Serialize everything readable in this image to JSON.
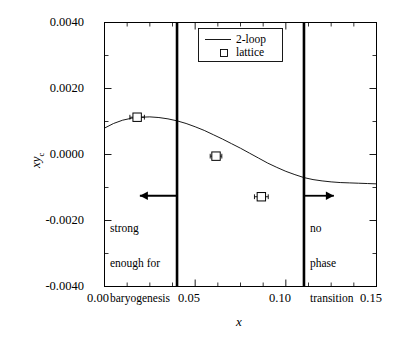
{
  "chart_data": {
    "type": "line",
    "title": "",
    "xlabel": "x",
    "ylabel": "xy_c",
    "xlim": [
      0.0,
      0.15
    ],
    "ylim": [
      -0.004,
      0.004
    ],
    "grid": false,
    "legend_position": "top-center-right",
    "x_ticks": [
      0.0,
      0.05,
      0.1,
      0.15
    ],
    "x_tick_labels": [
      "0.00",
      "0.05",
      "0.10",
      "0.15"
    ],
    "x_minor_ticks": [
      0.0125,
      0.025,
      0.0375,
      0.0625,
      0.075,
      0.0875,
      0.1125,
      0.125,
      0.1375
    ],
    "y_ticks": [
      -0.004,
      -0.002,
      0.0,
      0.002,
      0.004
    ],
    "y_tick_labels": [
      "-0.0040",
      "-0.0020",
      "0.0000",
      "0.0020",
      "0.0040"
    ],
    "y_minor_ticks": [
      -0.003,
      -0.001,
      0.001,
      0.003
    ],
    "series": [
      {
        "name": "2-loop",
        "type": "line",
        "points": [
          {
            "x": 0.0,
            "y": 0.0008
          },
          {
            "x": 0.005,
            "y": 0.00094
          },
          {
            "x": 0.01,
            "y": 0.00104
          },
          {
            "x": 0.015,
            "y": 0.0011
          },
          {
            "x": 0.02,
            "y": 0.00113
          },
          {
            "x": 0.025,
            "y": 0.00114
          },
          {
            "x": 0.03,
            "y": 0.00112
          },
          {
            "x": 0.035,
            "y": 0.00108
          },
          {
            "x": 0.04,
            "y": 0.00102
          },
          {
            "x": 0.045,
            "y": 0.00094
          },
          {
            "x": 0.05,
            "y": 0.00084
          },
          {
            "x": 0.055,
            "y": 0.00073
          },
          {
            "x": 0.06,
            "y": 0.0006
          },
          {
            "x": 0.065,
            "y": 0.00047
          },
          {
            "x": 0.07,
            "y": 0.00033
          },
          {
            "x": 0.075,
            "y": 0.00019
          },
          {
            "x": 0.08,
            "y": 4e-05
          },
          {
            "x": 0.085,
            "y": -0.00011
          },
          {
            "x": 0.09,
            "y": -0.00026
          },
          {
            "x": 0.095,
            "y": -0.00039
          },
          {
            "x": 0.1,
            "y": -0.00051
          },
          {
            "x": 0.105,
            "y": -0.00061
          },
          {
            "x": 0.11,
            "y": -0.0007
          },
          {
            "x": 0.115,
            "y": -0.00076
          },
          {
            "x": 0.12,
            "y": -0.0008
          },
          {
            "x": 0.125,
            "y": -0.00083
          },
          {
            "x": 0.13,
            "y": -0.00085
          },
          {
            "x": 0.135,
            "y": -0.00086
          },
          {
            "x": 0.14,
            "y": -0.00087
          },
          {
            "x": 0.145,
            "y": -0.00088
          },
          {
            "x": 0.15,
            "y": -0.00089
          }
        ]
      },
      {
        "name": "lattice",
        "type": "scatter",
        "marker": "open-square",
        "points": [
          {
            "x": 0.018,
            "y": 0.00113,
            "xerr": 0.004
          },
          {
            "x": 0.0615,
            "y": -5e-05,
            "xerr": 0.0032
          },
          {
            "x": 0.0865,
            "y": -0.00128,
            "xerr": 0.0038
          }
        ]
      }
    ],
    "vertical_lines": [
      {
        "x": 0.04
      },
      {
        "x": 0.11
      }
    ],
    "arrows": [
      {
        "from_x": 0.04,
        "to_x": 0.0195,
        "y": -0.00125,
        "direction": "left"
      },
      {
        "from_x": 0.11,
        "to_x": 0.1265,
        "y": -0.00125,
        "direction": "right"
      }
    ],
    "annotations": [
      {
        "text": "strong\nenough for\nbaryogenesis",
        "x": 0.0045,
        "y": -0.00205
      },
      {
        "text": "no\nphase\ntransition",
        "x": 0.1145,
        "y": -0.00205
      }
    ]
  },
  "legend": {
    "entries": [
      {
        "label": "2-loop",
        "marker": "line"
      },
      {
        "label": "lattice",
        "marker": "open-square"
      }
    ]
  },
  "axis_labels": {
    "x": "x",
    "y_main": "xy",
    "y_sub": "c"
  },
  "annotations": {
    "left": {
      "line1": "strong",
      "line2": "enough for",
      "line3": "baryogenesis"
    },
    "right": {
      "line1": "no",
      "line2": "phase",
      "line3": "transition"
    }
  },
  "colors": {
    "frame": "#000000",
    "curve": "#000000",
    "marker": "#000000",
    "vline": "#000000",
    "background": "#ffffff"
  }
}
